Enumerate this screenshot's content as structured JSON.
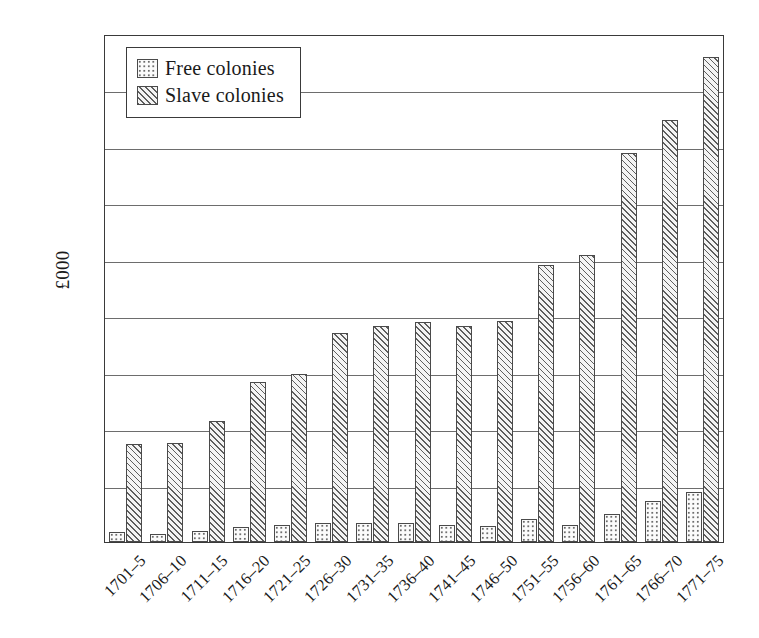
{
  "chart_data": {
    "type": "bar",
    "title": "",
    "subtitle": "",
    "xlabel": "",
    "ylabel": "£000",
    "ylim": [
      0,
      4500
    ],
    "ytick_step": 500,
    "yticks": [
      0,
      500,
      1000,
      1500,
      2000,
      2500,
      3000,
      3500,
      4000,
      4500
    ],
    "ytick_labels": [
      "0",
      "500",
      "1000",
      "1500",
      "2000",
      "2500",
      "3000",
      "3500",
      "4000",
      "4500"
    ],
    "grid": true,
    "grid_axis": "y",
    "legend_position": "upper-left-inside",
    "orientation": "vertical",
    "grouping": "grouped",
    "categories": [
      "1701–5",
      "1706–10",
      "1711–15",
      "1716–20",
      "1721–25",
      "1726–30",
      "1731–35",
      "1736–40",
      "1741–45",
      "1746–50",
      "1751–55",
      "1756–60",
      "1761–65",
      "1766–70",
      "1771–75"
    ],
    "series": [
      {
        "name": "Free colonies",
        "pattern": "dotted",
        "values": [
          85,
          70,
          100,
          135,
          155,
          170,
          170,
          170,
          150,
          145,
          200,
          150,
          250,
          360,
          440
        ]
      },
      {
        "name": "Slave colonies",
        "pattern": "diagonal-hatch",
        "values": [
          870,
          875,
          1070,
          1420,
          1490,
          1855,
          1910,
          1950,
          1910,
          1955,
          2450,
          2540,
          3450,
          3740,
          4300
        ]
      }
    ],
    "annotations": []
  },
  "legend": {
    "items": [
      {
        "label": "Free colonies",
        "swatch": "dotted-swatch-icon"
      },
      {
        "label": "Slave colonies",
        "swatch": "hatched-swatch-icon"
      }
    ]
  },
  "colors": {
    "axis": "#3a3a3a",
    "gridline": "#6d6d6d",
    "bar_outline": "#4a4a4a",
    "free_fill": "#fbfbfb",
    "slave_fill": "#f2f2f2",
    "background": "#ffffff",
    "text": "#1a1a1a"
  }
}
